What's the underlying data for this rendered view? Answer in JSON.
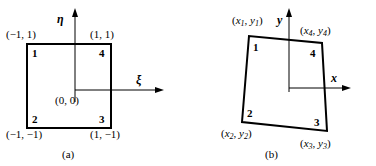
{
  "figure": {
    "line_color": "#000000",
    "background": "#ffffff"
  },
  "panel_a": {
    "caption": "(a)",
    "axes": {
      "horizontal_label": "ξ",
      "vertical_label": "η",
      "origin_label": "(0, 0)"
    },
    "shape": "square",
    "corner_labels": {
      "top_left": "(−1, 1)",
      "top_right": "(1, 1)",
      "bottom_left": "(−1, −1)",
      "bottom_right": "(1, −1)"
    },
    "nodes": [
      {
        "id": "1",
        "position": "top-left"
      },
      {
        "id": "2",
        "position": "bottom-left"
      },
      {
        "id": "3",
        "position": "bottom-right"
      },
      {
        "id": "4",
        "position": "top-right"
      }
    ]
  },
  "panel_b": {
    "caption": "(b)",
    "axes": {
      "horizontal_label": "x",
      "vertical_label": "y"
    },
    "shape": "quadrilateral",
    "corner_labels": {
      "node1": {
        "x": "x",
        "x_sub": "1",
        "y": "y",
        "y_sub": "1"
      },
      "node2": {
        "x": "x",
        "x_sub": "2",
        "y": "y",
        "y_sub": "2"
      },
      "node3": {
        "x": "x",
        "x_sub": "3",
        "y": "y",
        "y_sub": "3"
      },
      "node4": {
        "x": "x",
        "x_sub": "4",
        "y": "y",
        "y_sub": "4"
      }
    },
    "nodes": [
      {
        "id": "1",
        "position": "top-left"
      },
      {
        "id": "2",
        "position": "bottom-left"
      },
      {
        "id": "3",
        "position": "bottom-right"
      },
      {
        "id": "4",
        "position": "top-right"
      }
    ]
  }
}
